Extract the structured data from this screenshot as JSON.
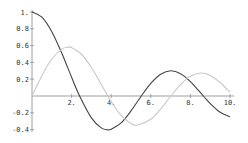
{
  "chart_data": {
    "type": "line",
    "title": "",
    "xlabel": "",
    "ylabel": "",
    "xlim": [
      0,
      10
    ],
    "ylim": [
      -0.45,
      1.05
    ],
    "grid": false,
    "legend": null,
    "x_ticks": [
      "2.",
      "4.",
      "6.",
      "8.",
      "10."
    ],
    "x_tick_values": [
      2,
      4,
      6,
      8,
      10
    ],
    "y_ticks": [
      "1.",
      "0.8",
      "0.6",
      "0.4",
      "0.2",
      "-0.2",
      "-0.4"
    ],
    "y_tick_values": [
      1,
      0.8,
      0.6,
      0.4,
      0.2,
      -0.2,
      -0.4
    ],
    "series": [
      {
        "name": "BesselJ0",
        "color": "#444444",
        "x": [
          0,
          0.5,
          1,
          1.5,
          2,
          2.405,
          3,
          3.5,
          3.832,
          4,
          4.5,
          5,
          5.52,
          6,
          6.5,
          7.016,
          7.5,
          8,
          8.654,
          9,
          9.5,
          10
        ],
        "values": [
          1,
          0.938,
          0.765,
          0.512,
          0.224,
          0,
          -0.26,
          -0.38,
          -0.403,
          -0.397,
          -0.321,
          -0.178,
          0,
          0.151,
          0.26,
          0.3,
          0.266,
          0.172,
          0,
          -0.09,
          -0.194,
          -0.246
        ]
      },
      {
        "name": "BesselJ1",
        "color": "#c8c8c8",
        "x": [
          0,
          0.5,
          1,
          1.5,
          1.841,
          2,
          2.5,
          3,
          3.5,
          3.832,
          4,
          4.5,
          5,
          5.331,
          6,
          6.5,
          7.016,
          7.5,
          8,
          8.536,
          9,
          9.5,
          10
        ],
        "values": [
          0,
          0.242,
          0.44,
          0.558,
          0.582,
          0.577,
          0.497,
          0.339,
          0.137,
          0,
          -0.066,
          -0.231,
          -0.328,
          -0.346,
          -0.277,
          -0.154,
          0,
          0.135,
          0.235,
          0.273,
          0.245,
          0.161,
          0.043
        ]
      }
    ]
  }
}
